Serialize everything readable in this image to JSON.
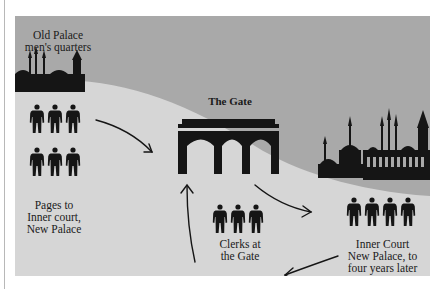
{
  "diagram": {
    "colors": {
      "sky": "#a9a9a9",
      "ground": "#d6d6d6",
      "silhouette": "#151515",
      "text": "#1a1a1a"
    },
    "labels": {
      "old_palace": "Old Palace\nmen's quarters",
      "gate": "The Gate",
      "pages": "Pages to\nInner court,\nNew Palace",
      "clerks": "Clerks at\nthe Gate",
      "inner_court": "Inner Court\nNew Palace, to\nfour years later"
    },
    "groups": {
      "pages_count": 6,
      "clerks_count": 3,
      "inner_court_count": 4
    },
    "icons": [
      "person-icon",
      "gate-icon",
      "old-palace-skyline-icon",
      "new-palace-skyline-icon",
      "arrow-icon"
    ]
  }
}
